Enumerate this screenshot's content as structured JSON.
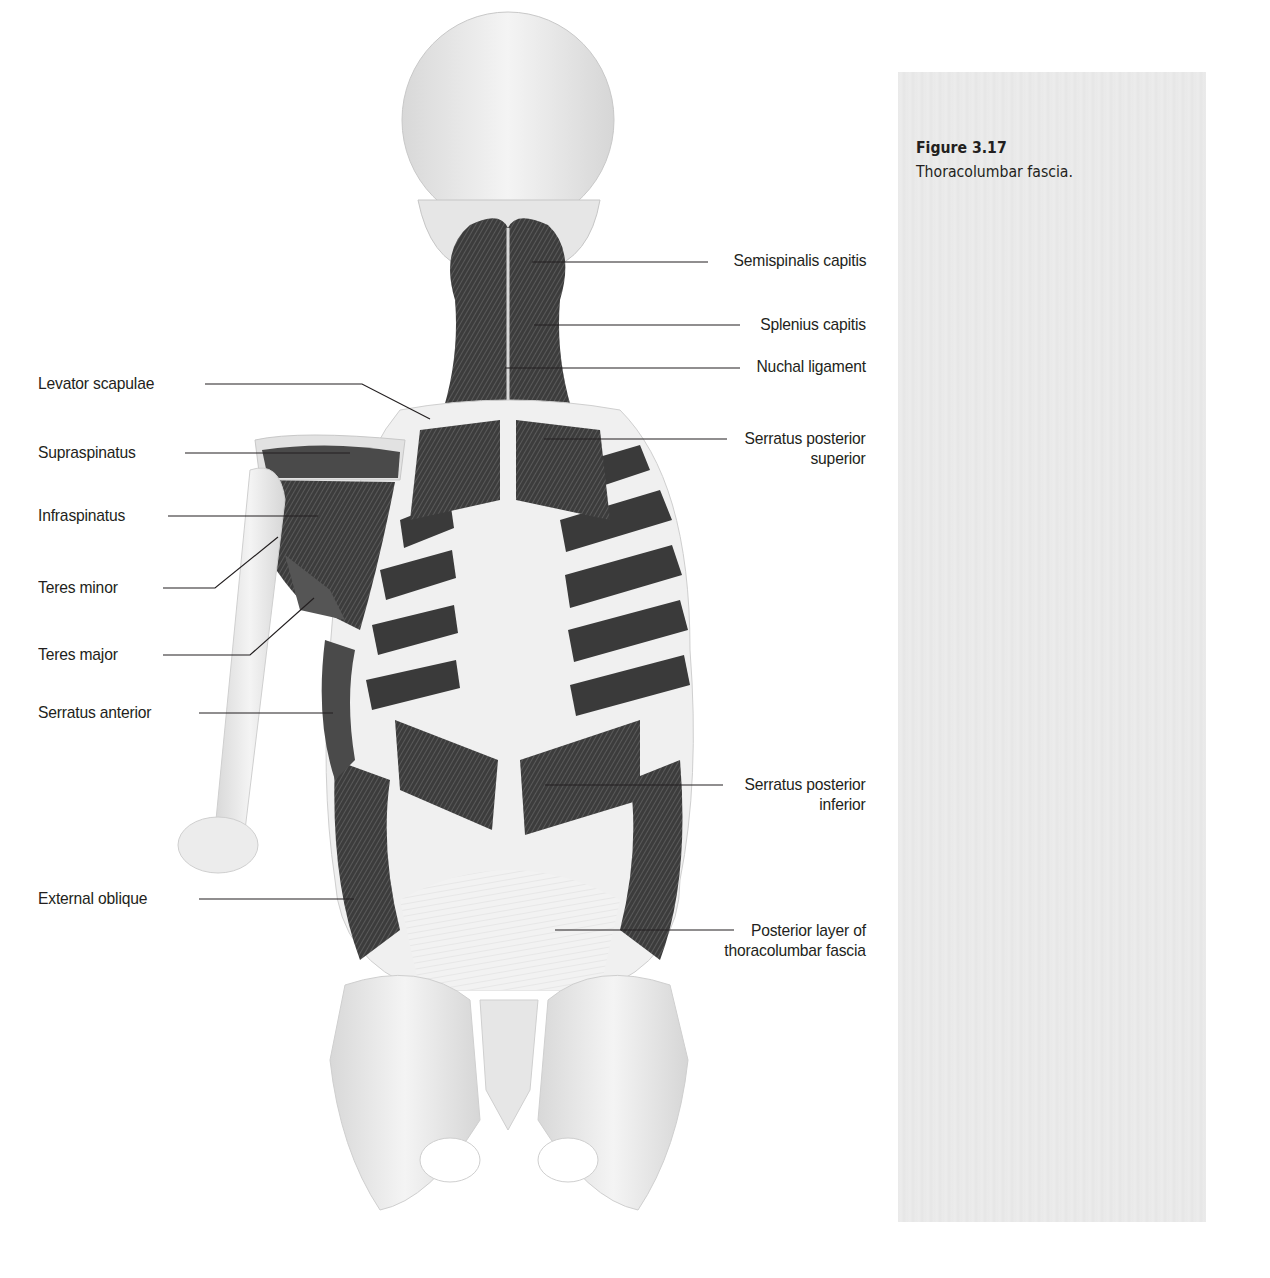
{
  "figure": {
    "number": "Figure 3.17",
    "caption": "Thoracolumbar fascia."
  },
  "labels": {
    "right": [
      {
        "id": "semispinalis-capitis",
        "text": "Semispinalis capitis"
      },
      {
        "id": "splenius-capitis",
        "text": "Splenius capitis"
      },
      {
        "id": "nuchal-ligament",
        "text": "Nuchal ligament"
      },
      {
        "id": "serratus-posterior-superior",
        "line1": "Serratus posterior",
        "line2": "superior"
      },
      {
        "id": "serratus-posterior-inferior",
        "line1": "Serratus posterior",
        "line2": "inferior"
      },
      {
        "id": "posterior-layer-thoracolumbar-fascia",
        "line1": "Posterior layer of",
        "line2": "thoracolumbar fascia"
      }
    ],
    "left": [
      {
        "id": "levator-scapulae",
        "text": "Levator scapulae"
      },
      {
        "id": "supraspinatus",
        "text": "Supraspinatus"
      },
      {
        "id": "infraspinatus",
        "text": "Infraspinatus"
      },
      {
        "id": "teres-minor",
        "text": "Teres minor"
      },
      {
        "id": "teres-major",
        "text": "Teres major"
      },
      {
        "id": "serratus-anterior",
        "text": "Serratus anterior"
      },
      {
        "id": "external-oblique",
        "text": "External oblique"
      }
    ]
  },
  "colors": {
    "muscle_dark": "#3a3a3a",
    "muscle_mid": "#6a6a6a",
    "bone": "#e4e4e4",
    "fascia": "#efefef",
    "leader_line": "#231f20",
    "caption_panel": "#e9e9e9"
  }
}
